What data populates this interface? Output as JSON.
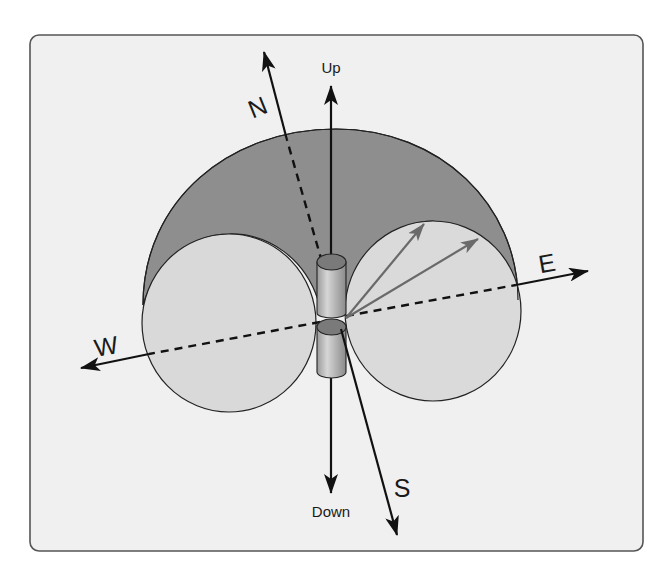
{
  "diagram": {
    "type": "antenna-radiation-pattern",
    "labels": {
      "up": "Up",
      "down": "Down",
      "north": "N",
      "south": "S",
      "east": "E",
      "west": "W"
    },
    "colors": {
      "frame_background": "#f0f0f0",
      "frame_border": "#555555",
      "torus_dark": "#8e8e8e",
      "lobe_fill": "#d9d9d9",
      "antenna_body": "#b9b9b9",
      "antenna_cap": "#7a7a7a",
      "axis_stroke": "#111111",
      "radiation_vector": "#6a6a6a"
    },
    "elements": {
      "antenna": "vertical dipole antenna with two cylinder elements",
      "left_lobe": "circular cross-section of radiation pattern (west side)",
      "right_lobe": "circular cross-section of radiation pattern (east side)",
      "dome": "upper shaded half of toroidal radiation pattern",
      "radiation_vectors": 2
    }
  }
}
